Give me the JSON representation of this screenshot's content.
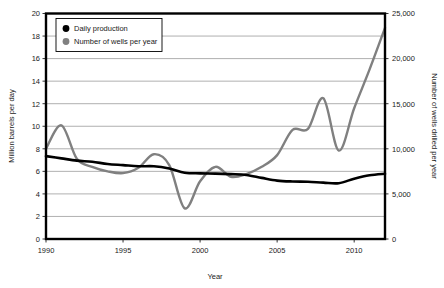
{
  "chart_data": {
    "type": "line",
    "title": "",
    "xlabel": "Year",
    "ylabel": "Million barrels per day",
    "y2label": "Number of wells drilled per year",
    "xlim": [
      1990,
      2012
    ],
    "ylim": [
      0,
      20
    ],
    "y2lim": [
      0,
      25000
    ],
    "grid": true,
    "legend_position": "top-left",
    "xticks": [
      "1990",
      "1995",
      "2000",
      "2005",
      "2010"
    ],
    "xtick_values": [
      1990,
      1995,
      2000,
      2005,
      2010
    ],
    "yticks": [
      "0",
      "2",
      "4",
      "6",
      "8",
      "10",
      "12",
      "14",
      "16",
      "18",
      "20"
    ],
    "ytick_values": [
      0,
      2,
      4,
      6,
      8,
      10,
      12,
      14,
      16,
      18,
      20
    ],
    "y2ticks": [
      "0",
      "5,000",
      "10,000",
      "15,000",
      "20,000",
      "25,000"
    ],
    "y2tick_values": [
      0,
      5000,
      10000,
      15000,
      20000,
      25000
    ],
    "x": [
      1990,
      1991,
      1992,
      1993,
      1994,
      1995,
      1996,
      1997,
      1998,
      1999,
      2000,
      2001,
      2002,
      2003,
      2004,
      2005,
      2006,
      2007,
      2008,
      2009,
      2010,
      2011,
      2012
    ],
    "series": [
      {
        "name": "Daily production",
        "axis": "left",
        "units": "Million barrels per day",
        "color": "#000000",
        "marker": "circle",
        "values": [
          7.35,
          7.15,
          6.95,
          6.85,
          6.65,
          6.55,
          6.45,
          6.45,
          6.25,
          5.88,
          5.82,
          5.8,
          5.75,
          5.68,
          5.42,
          5.18,
          5.1,
          5.08,
          5.0,
          4.95,
          5.35,
          5.65,
          5.78
        ]
      },
      {
        "name": "Number of wells per year",
        "axis": "right",
        "units": "Number of wells drilled per year",
        "color": "#808080",
        "marker": "circle",
        "values": [
          10000,
          12600,
          8900,
          8000,
          7500,
          7300,
          7900,
          9400,
          8200,
          3400,
          6400,
          8000,
          6900,
          7200,
          8000,
          9300,
          12100,
          12200,
          15600,
          9800,
          14500,
          18800,
          23400
        ]
      }
    ],
    "series_left_in_right_units": null
  },
  "legend": {
    "entries": [
      {
        "label": "Daily production",
        "color": "#000000"
      },
      {
        "label": "Number of wells per year",
        "color": "#808080"
      }
    ]
  }
}
